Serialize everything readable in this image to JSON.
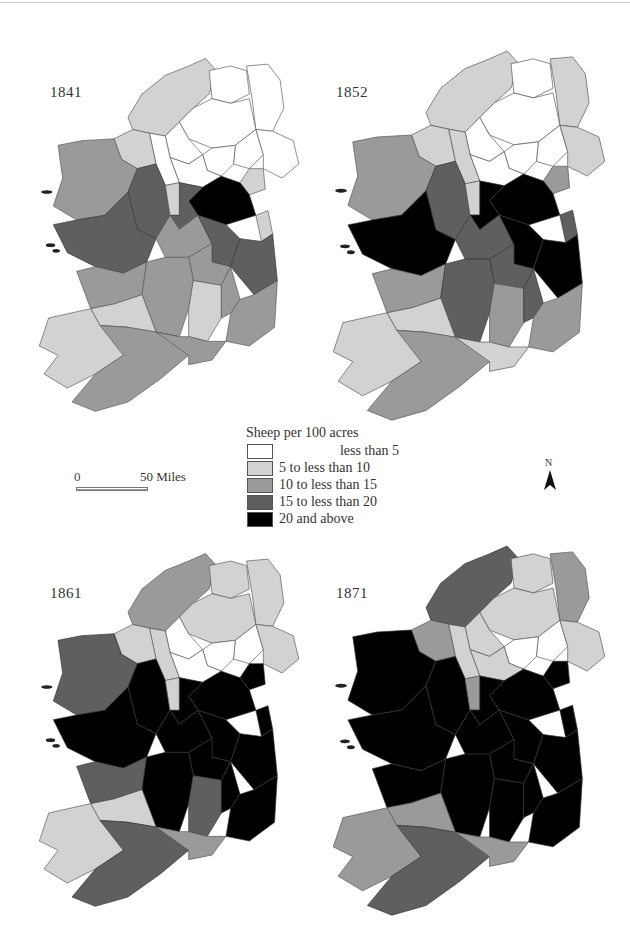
{
  "figure": {
    "legend": {
      "title": "Sheep per 100 acres",
      "classes": [
        {
          "label": "less than 5",
          "color": "#ffffff",
          "align": "right"
        },
        {
          "label": "5 to less than 10",
          "color": "#d2d2d2",
          "align": "left"
        },
        {
          "label": "10 to less than 15",
          "color": "#9a9a9a",
          "align": "left"
        },
        {
          "label": "15 to less than 20",
          "color": "#5f5f5f",
          "align": "left"
        },
        {
          "label": "20 and above",
          "color": "#000000",
          "align": "left"
        }
      ]
    },
    "scale": {
      "zero_label": "0",
      "max_label": "50 Miles"
    },
    "north_arrow": {
      "label": "N"
    },
    "maps": [
      {
        "year": "1841"
      },
      {
        "year": "1852"
      },
      {
        "year": "1861"
      },
      {
        "year": "1871"
      }
    ]
  },
  "chart_data": {
    "type": "choropleth",
    "title": "Sheep per 100 acres",
    "legend_position": "center",
    "class_labels": [
      "less than 5",
      "5 to less than 10",
      "10 to less than 15",
      "15 to less than 20",
      "20 and above"
    ],
    "panels": [
      {
        "year": "1841",
        "regions": {
          "donegal": 1,
          "derry": 0,
          "antrim": 0,
          "tyrone": 0,
          "fermanagh": 0,
          "armagh": 0,
          "down": 0,
          "monaghan": 0,
          "cavan": 0,
          "leitrim": 0,
          "sligo": 1,
          "mayo": 2,
          "roscommon": 3,
          "longford": 1,
          "louth": 1,
          "meath": 4,
          "westmeath": 3,
          "dublin": 1,
          "galway": 3,
          "offaly": 2,
          "kildare": 3,
          "laois": 2,
          "wicklow": 3,
          "clare": 2,
          "tipperary": 2,
          "kilkenny": 1,
          "carlow": 2,
          "wexford": 2,
          "limerick": 1,
          "kerry": 1,
          "cork": 2,
          "waterford": 2
        }
      },
      {
        "year": "1852",
        "regions": {
          "donegal": 1,
          "derry": 0,
          "antrim": 1,
          "tyrone": 0,
          "fermanagh": 0,
          "armagh": 0,
          "down": 1,
          "monaghan": 0,
          "cavan": 0,
          "leitrim": 1,
          "sligo": 1,
          "mayo": 2,
          "roscommon": 3,
          "longford": 1,
          "louth": 2,
          "meath": 4,
          "westmeath": 4,
          "dublin": 3,
          "galway": 4,
          "offaly": 3,
          "kildare": 4,
          "laois": 3,
          "wicklow": 4,
          "clare": 2,
          "tipperary": 3,
          "kilkenny": 2,
          "carlow": 3,
          "wexford": 2,
          "limerick": 1,
          "kerry": 1,
          "cork": 2,
          "waterford": 1
        }
      },
      {
        "year": "1861",
        "regions": {
          "donegal": 2,
          "derry": 1,
          "antrim": 1,
          "tyrone": 1,
          "fermanagh": 0,
          "armagh": 0,
          "down": 1,
          "monaghan": 0,
          "cavan": 0,
          "leitrim": 1,
          "sligo": 1,
          "mayo": 3,
          "roscommon": 4,
          "longford": 1,
          "louth": 4,
          "meath": 4,
          "westmeath": 4,
          "dublin": 4,
          "galway": 4,
          "offaly": 4,
          "kildare": 4,
          "laois": 4,
          "wicklow": 4,
          "clare": 3,
          "tipperary": 4,
          "kilkenny": 3,
          "carlow": 4,
          "wexford": 4,
          "limerick": 1,
          "kerry": 1,
          "cork": 3,
          "waterford": 2
        }
      },
      {
        "year": "1871",
        "regions": {
          "donegal": 3,
          "derry": 1,
          "antrim": 2,
          "tyrone": 1,
          "fermanagh": 1,
          "armagh": 0,
          "down": 1,
          "monaghan": 0,
          "cavan": 1,
          "leitrim": 1,
          "sligo": 2,
          "mayo": 4,
          "roscommon": 4,
          "longford": 2,
          "louth": 4,
          "meath": 4,
          "westmeath": 4,
          "dublin": 4,
          "galway": 4,
          "offaly": 4,
          "kildare": 4,
          "laois": 4,
          "wicklow": 4,
          "clare": 4,
          "tipperary": 4,
          "kilkenny": 4,
          "carlow": 4,
          "wexford": 4,
          "limerick": 2,
          "kerry": 2,
          "cork": 3,
          "waterford": 2
        }
      }
    ]
  }
}
